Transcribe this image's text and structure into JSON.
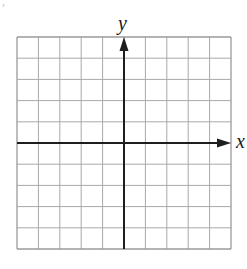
{
  "diagram": {
    "type": "coordinate-grid",
    "grid": {
      "left": 17,
      "top": 37,
      "right": 231,
      "bottom": 249,
      "columns": 10,
      "rows": 10,
      "line_color": "#a8a8a8",
      "border_color": "#9a9a9a"
    },
    "axes": {
      "color": "#1e1e1e",
      "x_axis": {
        "label": "x",
        "row_index": 5,
        "arrow": "right"
      },
      "y_axis": {
        "label": "y",
        "column_index": 5,
        "arrow": "up"
      }
    }
  },
  "labels": {
    "x": "x",
    "y": "y"
  }
}
